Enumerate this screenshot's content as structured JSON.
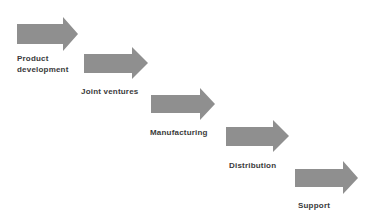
{
  "diagram": {
    "type": "staircase-process-flow",
    "arrow_color": "#8f8f8f",
    "text_color": "#3a3a3a",
    "steps": [
      {
        "label_line1": "Product",
        "label_line2": "development"
      },
      {
        "label_line1": "Joint ventures",
        "label_line2": ""
      },
      {
        "label_line1": "Manufacturing",
        "label_line2": ""
      },
      {
        "label_line1": "Distribution",
        "label_line2": ""
      },
      {
        "label_line1": "Support",
        "label_line2": ""
      }
    ]
  }
}
